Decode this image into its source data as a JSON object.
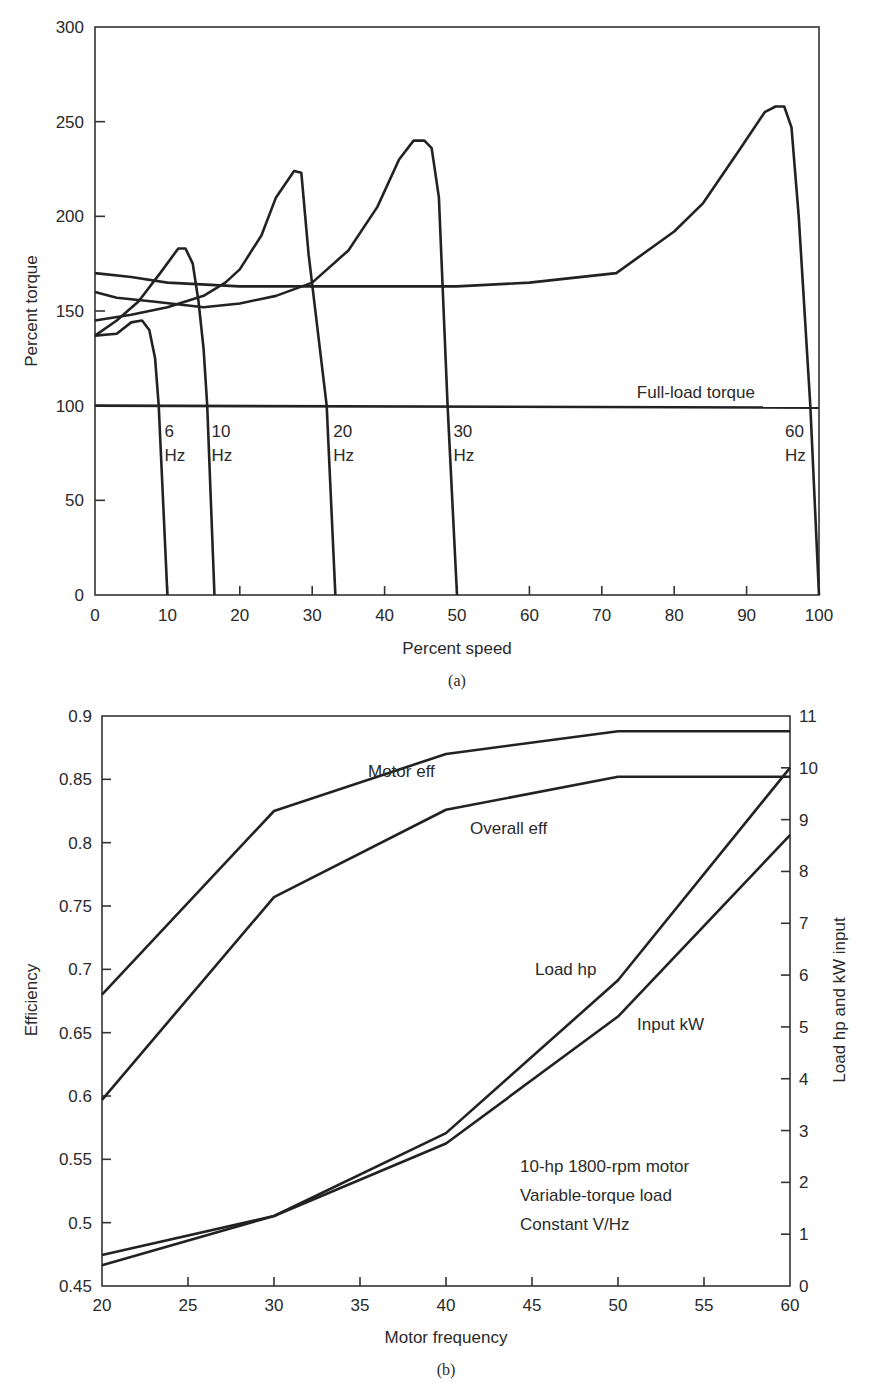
{
  "chart_data": [
    {
      "id": "a",
      "type": "line",
      "caption": "(a)",
      "title": "",
      "xlabel": "Percent speed",
      "ylabel": "Percent torque",
      "xlim": [
        0,
        100
      ],
      "ylim": [
        0,
        300
      ],
      "xticks": [
        0,
        10,
        20,
        30,
        40,
        50,
        60,
        70,
        80,
        90,
        100
      ],
      "yticks": [
        0,
        50,
        100,
        150,
        200,
        250,
        300
      ],
      "grid": false,
      "reference_line": {
        "name": "Full-load torque",
        "y": 100,
        "label": "Full-load torque"
      },
      "series": [
        {
          "name": "6 Hz",
          "label_line1": "6",
          "label_line2": "Hz",
          "x": [
            0,
            3,
            5,
            6.5,
            7.5,
            8.3,
            8.8,
            10
          ],
          "y": [
            137,
            138,
            144,
            145,
            140,
            125,
            100,
            0
          ]
        },
        {
          "name": "10 Hz",
          "label_line1": "10",
          "label_line2": "Hz",
          "x": [
            0,
            3,
            6,
            9,
            11.5,
            12.5,
            13.5,
            14.3,
            15,
            15.5,
            16.5
          ],
          "y": [
            137,
            145,
            155,
            170,
            183,
            183,
            175,
            155,
            130,
            100,
            0
          ]
        },
        {
          "name": "20 Hz",
          "label_line1": "20",
          "label_line2": "Hz",
          "x": [
            0,
            5,
            10,
            15,
            18,
            20,
            23,
            25,
            27.5,
            28.5,
            29.5,
            32,
            33.2
          ],
          "y": [
            145,
            148,
            152,
            158,
            165,
            172,
            190,
            210,
            224,
            223,
            180,
            100,
            0
          ]
        },
        {
          "name": "30 Hz",
          "label_line1": "30",
          "label_line2": "Hz",
          "x": [
            0,
            3,
            8,
            15,
            20,
            25,
            30,
            35,
            39,
            42,
            44,
            45.5,
            46.5,
            47.5,
            48.7,
            50
          ],
          "y": [
            160,
            157,
            155,
            152,
            154,
            158,
            165,
            182,
            205,
            230,
            240,
            240,
            236,
            210,
            100,
            0
          ]
        },
        {
          "name": "60 Hz",
          "label_line1": "60",
          "label_line2": "Hz",
          "x": [
            0,
            5,
            10,
            20,
            50,
            60,
            72,
            80,
            84,
            89,
            92.5,
            94,
            95.2,
            96.2,
            97.2,
            98.8,
            100
          ],
          "y": [
            170,
            168,
            165,
            163,
            163,
            165,
            170,
            192,
            207,
            235,
            255,
            258,
            258,
            247,
            200,
            100,
            0
          ]
        }
      ]
    },
    {
      "id": "b",
      "type": "line",
      "caption": "(b)",
      "title": "",
      "xlabel": "Motor frequency",
      "ylabel": "Efficiency",
      "ylabel_right": "Load hp and kW input",
      "xlim": [
        20,
        60
      ],
      "ylim": [
        0.45,
        0.9
      ],
      "ylim_right": [
        0,
        11
      ],
      "xticks": [
        20,
        25,
        30,
        35,
        40,
        45,
        50,
        55,
        60
      ],
      "yticks": [
        "0.45",
        "0.5",
        "0.55",
        "0.6",
        "0.65",
        "0.7",
        "0.75",
        "0.8",
        "0.85",
        "0.9"
      ],
      "yticks_right": [
        0,
        1,
        2,
        3,
        4,
        5,
        6,
        7,
        8,
        9,
        10,
        11
      ],
      "grid": false,
      "annotation": [
        "10-hp 1800-rpm motor",
        "Variable-torque load",
        "Constant V/Hz"
      ],
      "categories": [
        20,
        30,
        40,
        50,
        60
      ],
      "series": [
        {
          "name": "Motor eff",
          "axis": "left",
          "values": [
            0.68,
            0.825,
            0.87,
            0.888,
            0.888
          ]
        },
        {
          "name": "Overall eff",
          "axis": "left",
          "values": [
            0.597,
            0.757,
            0.826,
            0.852,
            0.852
          ]
        },
        {
          "name": "Load hp",
          "axis": "right",
          "values": [
            0.6,
            1.35,
            2.95,
            5.9,
            10.0
          ]
        },
        {
          "name": "Input kW",
          "axis": "right",
          "values": [
            0.4,
            1.35,
            2.75,
            5.2,
            8.7
          ]
        }
      ]
    }
  ]
}
